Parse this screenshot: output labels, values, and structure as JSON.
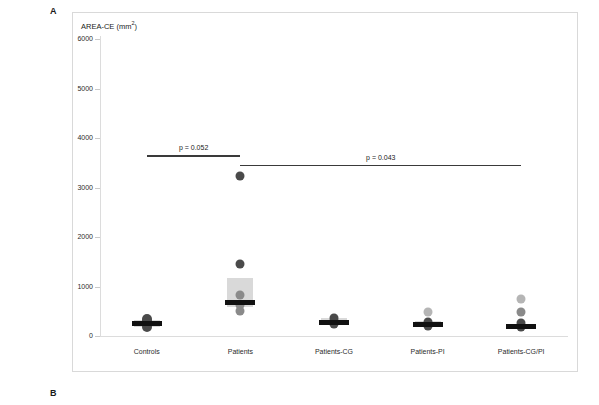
{
  "panels": {
    "a_label": "A",
    "b_label": "B"
  },
  "chart_data": {
    "type": "box",
    "ylabel": "AREA-CE (mm²)",
    "xlabel": "",
    "ylim": [
      0,
      6000
    ],
    "yticks": [
      0,
      1000,
      2000,
      3000,
      4000,
      5000,
      6000
    ],
    "ytick_labels": [
      "0",
      "1000",
      "2000",
      "3000",
      "4000",
      "5000",
      "6000"
    ],
    "grid": false,
    "legend": "none",
    "categories": [
      "Controls",
      "Patients",
      "Patients-CG",
      "Patients-PI",
      "Patients-CG/PI"
    ],
    "series": [
      {
        "name": "Controls",
        "q1": 195,
        "median": 280,
        "q3": 350,
        "points": [
          210,
          255,
          280,
          300,
          330,
          370
        ]
      },
      {
        "name": "Patients",
        "q1": 600,
        "median": 700,
        "q3": 1190,
        "points": [
          3250,
          1480,
          850,
          640,
          530
        ]
      },
      {
        "name": "Patients-CG",
        "q1": 250,
        "median": 295,
        "q3": 390,
        "points": [
          390,
          330,
          295,
          260
        ]
      },
      {
        "name": "Patients-PI",
        "q1": 215,
        "median": 255,
        "q3": 330,
        "points": [
          510,
          300,
          255,
          225
        ]
      },
      {
        "name": "Patients-CG/PI",
        "q1": 160,
        "median": 210,
        "q3": 260,
        "points": [
          760,
          500,
          275,
          205
        ]
      }
    ],
    "annotations": [
      {
        "label": "p = 0.052",
        "from_category": "Controls",
        "to_category": "Patients",
        "y": 3670
      },
      {
        "label": "p = 0.043",
        "from_category": "Patients",
        "to_category": "Patients-CG/PI",
        "y": 3480
      }
    ],
    "colors": {
      "box_fill": "#d9d9d9",
      "median": "#111111",
      "point_dark": "#4a4a4a",
      "point_mid": "#8a8a8a",
      "point_light": "#b5b5b5",
      "frame": "#d9d9d9",
      "annotation_line": "#3a3a3a"
    }
  }
}
